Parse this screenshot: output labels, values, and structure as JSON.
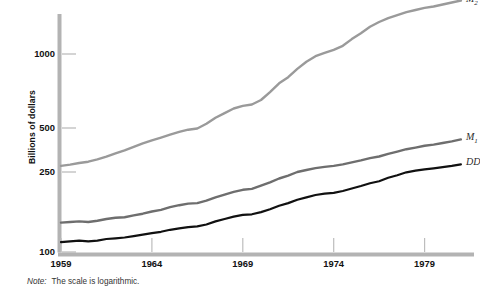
{
  "chart_data": {
    "type": "line",
    "title": "",
    "xlabel": "",
    "ylabel": "Billions of dollars",
    "scale": "logarithmic",
    "grid": false,
    "legend_position": "right-end-of-line",
    "xlim": [
      1959,
      1981.5
    ],
    "ylim": [
      100,
      1700
    ],
    "ytick_labels": [
      "100",
      "250",
      "500",
      "1000"
    ],
    "ytick_values": [
      100,
      250,
      500,
      1000
    ],
    "xtick_labels": [
      "1959",
      "1964",
      "1969",
      "1974",
      "1979"
    ],
    "xtick_values": [
      1959,
      1964,
      1969,
      1974,
      1979
    ],
    "x": [
      1959,
      1959.5,
      1960,
      1960.5,
      1961,
      1961.5,
      1962,
      1962.5,
      1963,
      1963.5,
      1964,
      1964.5,
      1965,
      1965.5,
      1966,
      1966.5,
      1967,
      1967.5,
      1968,
      1968.5,
      1969,
      1969.5,
      1970,
      1970.5,
      1971,
      1971.5,
      1972,
      1972.5,
      1973,
      1973.5,
      1974,
      1974.5,
      1975,
      1975.5,
      1976,
      1976.5,
      1977,
      1977.5,
      1978,
      1978.5,
      1979,
      1979.5,
      1980,
      1980.5,
      1981
    ],
    "series": [
      {
        "name": "M2",
        "label": "M",
        "sublabel": "2",
        "color": "#9a9a9a",
        "values": [
          275,
          281,
          288,
          294,
          305,
          318,
          335,
          352,
          372,
          392,
          412,
          430,
          450,
          470,
          487,
          496,
          520,
          550,
          575,
          600,
          615,
          623,
          650,
          700,
          760,
          805,
          870,
          930,
          980,
          1010,
          1040,
          1080,
          1150,
          1215,
          1290,
          1350,
          1400,
          1440,
          1480,
          1510,
          1540,
          1560,
          1590,
          1620,
          1650
        ]
      },
      {
        "name": "M1",
        "label": "M",
        "sublabel": "1",
        "color": "#6e6e6e",
        "values": [
          140,
          141,
          142,
          141,
          143,
          146,
          148,
          149,
          152,
          155,
          159,
          162,
          167,
          171,
          174,
          175,
          180,
          187,
          193,
          199,
          204,
          206,
          214,
          222,
          232,
          240,
          250,
          258,
          266,
          271,
          275,
          282,
          291,
          300,
          311,
          319,
          333,
          345,
          358,
          367,
          378,
          385,
          395,
          405,
          418
        ]
      },
      {
        "name": "DD",
        "label": "DD",
        "sublabel": "",
        "color": "#111111",
        "values": [
          112,
          113,
          114,
          113,
          114,
          116,
          117,
          118,
          120,
          122,
          124,
          126,
          129,
          131,
          133,
          134,
          137,
          142,
          146,
          150,
          153,
          154,
          158,
          163,
          170,
          175,
          182,
          187,
          192,
          195,
          197,
          201,
          207,
          213,
          220,
          225,
          234,
          241,
          249,
          255,
          261,
          265,
          270,
          275,
          282
        ]
      }
    ],
    "note_prefix": "Note:",
    "note_text": "The scale is logarithmic."
  }
}
